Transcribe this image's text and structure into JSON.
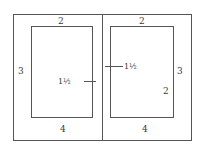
{
  "diagram": {
    "left_page": {
      "top_margin": "2",
      "outer_margin": "3",
      "inner_margin": "1½",
      "bottom_margin": "4"
    },
    "right_page": {
      "top_margin": "2",
      "outer_margin": "3",
      "inner_margin": "1½",
      "bottom_margin": "4",
      "inner_label": "2"
    }
  },
  "colors": {
    "line": "#555555",
    "text": "#3a3a3a",
    "background": "#ffffff"
  }
}
